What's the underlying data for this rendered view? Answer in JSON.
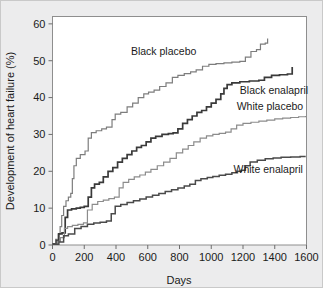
{
  "figure": {
    "background_color": "#ececed",
    "plot_background_color": "#ffffff",
    "frame_color": "#8e8e8e"
  },
  "chart_data": {
    "type": "line",
    "title": "",
    "subtitle": "",
    "xlabel": "Days",
    "ylabel": "Development of heart failure (%)",
    "xlim": [
      0,
      1600
    ],
    "ylim": [
      0,
      62
    ],
    "xticks": [
      0,
      200,
      400,
      600,
      800,
      1000,
      1200,
      1400,
      1600
    ],
    "yticks": [
      0,
      10,
      20,
      30,
      40,
      50,
      60
    ],
    "xtick_labels": [
      "0",
      "200",
      "400",
      "600",
      "800",
      "1000",
      "1200",
      "1400",
      "1600"
    ],
    "ytick_labels": [
      "0",
      "10",
      "20",
      "30",
      "40",
      "50",
      "60"
    ],
    "grid": false,
    "legend_position": "inline-annotations",
    "line_style": "step-after",
    "annotations": [
      {
        "text": "Black placebo",
        "x": 700,
        "y": 51.5,
        "anchor": "middle"
      },
      {
        "text": "Black enalapril",
        "x": 1180,
        "y": 41.0,
        "anchor": "start"
      },
      {
        "text": "White placebo",
        "x": 1160,
        "y": 36.5,
        "anchor": "start"
      },
      {
        "text": "White enalapril",
        "x": 1140,
        "y": 19.5,
        "anchor": "start"
      }
    ],
    "series": [
      {
        "name": "Black placebo",
        "color": "#7d7d7d",
        "width": 1.2,
        "points": [
          [
            0,
            0.4
          ],
          [
            20,
            1.5
          ],
          [
            35,
            3.0
          ],
          [
            48,
            5.0
          ],
          [
            58,
            8.0
          ],
          [
            70,
            10.5
          ],
          [
            85,
            12.0
          ],
          [
            100,
            13.0
          ],
          [
            115,
            14.0
          ],
          [
            125,
            18.0
          ],
          [
            135,
            21.5
          ],
          [
            150,
            23.5
          ],
          [
            175,
            24.5
          ],
          [
            205,
            25.5
          ],
          [
            225,
            29.0
          ],
          [
            245,
            30.5
          ],
          [
            275,
            31.0
          ],
          [
            310,
            31.5
          ],
          [
            340,
            32.0
          ],
          [
            375,
            34.0
          ],
          [
            395,
            35.5
          ],
          [
            430,
            36.0
          ],
          [
            470,
            37.5
          ],
          [
            505,
            38.5
          ],
          [
            540,
            40.0
          ],
          [
            575,
            41.0
          ],
          [
            605,
            41.5
          ],
          [
            640,
            42.0
          ],
          [
            675,
            43.0
          ],
          [
            715,
            44.0
          ],
          [
            755,
            45.5
          ],
          [
            790,
            46.0
          ],
          [
            830,
            46.5
          ],
          [
            870,
            47.0
          ],
          [
            905,
            47.5
          ],
          [
            945,
            48.5
          ],
          [
            985,
            49.0
          ],
          [
            1030,
            49.2
          ],
          [
            1080,
            49.4
          ],
          [
            1130,
            49.6
          ],
          [
            1180,
            49.8
          ],
          [
            1215,
            51.0
          ],
          [
            1250,
            52.5
          ],
          [
            1285,
            53.0
          ],
          [
            1310,
            54.5
          ],
          [
            1340,
            54.8
          ],
          [
            1355,
            56.0
          ]
        ]
      },
      {
        "name": "Black enalapril",
        "color": "#3a3a3a",
        "width": 1.7,
        "points": [
          [
            0,
            0.3
          ],
          [
            25,
            1.2
          ],
          [
            40,
            3.0
          ],
          [
            60,
            3.3
          ],
          [
            80,
            7.5
          ],
          [
            95,
            9.5
          ],
          [
            120,
            9.8
          ],
          [
            150,
            10.0
          ],
          [
            175,
            10.2
          ],
          [
            200,
            10.5
          ],
          [
            225,
            13.0
          ],
          [
            245,
            15.5
          ],
          [
            265,
            16.5
          ],
          [
            295,
            17.0
          ],
          [
            320,
            18.5
          ],
          [
            350,
            20.0
          ],
          [
            380,
            21.0
          ],
          [
            410,
            22.5
          ],
          [
            440,
            23.5
          ],
          [
            470,
            24.5
          ],
          [
            500,
            25.5
          ],
          [
            530,
            26.5
          ],
          [
            560,
            27.0
          ],
          [
            590,
            28.0
          ],
          [
            620,
            29.0
          ],
          [
            650,
            29.5
          ],
          [
            690,
            30.0
          ],
          [
            730,
            30.2
          ],
          [
            760,
            30.4
          ],
          [
            790,
            31.5
          ],
          [
            820,
            33.0
          ],
          [
            850,
            34.0
          ],
          [
            880,
            35.0
          ],
          [
            910,
            36.0
          ],
          [
            940,
            36.5
          ],
          [
            970,
            37.5
          ],
          [
            1000,
            38.5
          ],
          [
            1030,
            39.5
          ],
          [
            1060,
            41.0
          ],
          [
            1080,
            42.5
          ],
          [
            1100,
            43.5
          ],
          [
            1130,
            44.0
          ],
          [
            1180,
            44.3
          ],
          [
            1240,
            44.5
          ],
          [
            1300,
            44.7
          ],
          [
            1335,
            45.5
          ],
          [
            1380,
            46.0
          ],
          [
            1430,
            46.2
          ],
          [
            1480,
            46.4
          ],
          [
            1510,
            48.3
          ]
        ]
      },
      {
        "name": "White placebo",
        "color": "#8c8c8c",
        "width": 1.2,
        "points": [
          [
            0,
            0.2
          ],
          [
            30,
            1.0
          ],
          [
            50,
            2.0
          ],
          [
            75,
            4.5
          ],
          [
            95,
            5.0
          ],
          [
            125,
            5.3
          ],
          [
            160,
            5.6
          ],
          [
            195,
            6.0
          ],
          [
            220,
            9.5
          ],
          [
            250,
            11.0
          ],
          [
            285,
            11.8
          ],
          [
            320,
            12.2
          ],
          [
            355,
            12.6
          ],
          [
            390,
            13.0
          ],
          [
            420,
            15.5
          ],
          [
            445,
            17.0
          ],
          [
            480,
            17.8
          ],
          [
            515,
            18.5
          ],
          [
            550,
            19.0
          ],
          [
            585,
            19.8
          ],
          [
            620,
            20.5
          ],
          [
            660,
            21.5
          ],
          [
            700,
            22.5
          ],
          [
            740,
            23.5
          ],
          [
            780,
            25.0
          ],
          [
            820,
            26.0
          ],
          [
            855,
            27.0
          ],
          [
            890,
            28.0
          ],
          [
            930,
            29.0
          ],
          [
            970,
            29.6
          ],
          [
            1010,
            30.0
          ],
          [
            1050,
            30.3
          ],
          [
            1090,
            30.6
          ],
          [
            1125,
            31.5
          ],
          [
            1160,
            32.5
          ],
          [
            1200,
            33.0
          ],
          [
            1250,
            33.3
          ],
          [
            1300,
            33.6
          ],
          [
            1350,
            33.9
          ],
          [
            1400,
            34.2
          ],
          [
            1450,
            34.4
          ],
          [
            1500,
            34.6
          ],
          [
            1550,
            34.8
          ],
          [
            1595,
            35.0
          ]
        ]
      },
      {
        "name": "White enalapril",
        "color": "#4a4a4a",
        "width": 1.5,
        "points": [
          [
            0,
            0.2
          ],
          [
            40,
            0.8
          ],
          [
            70,
            2.5
          ],
          [
            100,
            3.0
          ],
          [
            140,
            4.5
          ],
          [
            180,
            5.0
          ],
          [
            220,
            5.6
          ],
          [
            260,
            6.0
          ],
          [
            300,
            6.2
          ],
          [
            340,
            6.5
          ],
          [
            370,
            8.5
          ],
          [
            395,
            10.5
          ],
          [
            430,
            11.0
          ],
          [
            470,
            11.5
          ],
          [
            510,
            12.0
          ],
          [
            550,
            12.5
          ],
          [
            590,
            13.0
          ],
          [
            630,
            13.5
          ],
          [
            670,
            14.0
          ],
          [
            710,
            14.5
          ],
          [
            750,
            15.0
          ],
          [
            790,
            15.5
          ],
          [
            830,
            16.0
          ],
          [
            865,
            16.5
          ],
          [
            900,
            17.5
          ],
          [
            935,
            18.0
          ],
          [
            975,
            18.3
          ],
          [
            1010,
            18.6
          ],
          [
            1050,
            18.9
          ],
          [
            1090,
            19.2
          ],
          [
            1130,
            19.6
          ],
          [
            1165,
            20.0
          ],
          [
            1190,
            20.3
          ],
          [
            1215,
            21.5
          ],
          [
            1245,
            22.5
          ],
          [
            1290,
            23.0
          ],
          [
            1340,
            23.4
          ],
          [
            1390,
            23.6
          ],
          [
            1440,
            23.8
          ],
          [
            1500,
            23.9
          ],
          [
            1560,
            24.0
          ],
          [
            1595,
            24.0
          ]
        ]
      }
    ]
  }
}
